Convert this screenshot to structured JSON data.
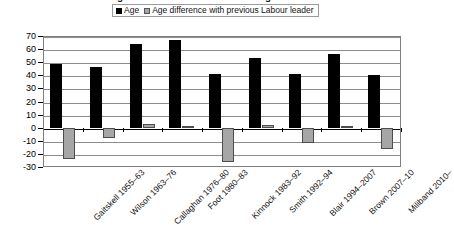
{
  "chart_data": {
    "type": "bar",
    "title": "Ages of Labour leaders on taking office",
    "categories": [
      "Gaitskell 1955–63",
      "Wilson 1963–76",
      "Callaghan 1976–80",
      "Foot 1980–83",
      "Kinnock 1983–92",
      "Smith 1992–94",
      "Blair 1994–2007",
      "Brown 2007–10",
      "Miliband 2010–"
    ],
    "series": [
      {
        "name": "Age",
        "color": "#000000",
        "values": [
          49,
          46,
          64,
          67,
          41,
          53,
          41,
          56,
          40
        ]
      },
      {
        "name": "Age difference with previous Labour leader",
        "color": "#a6a6a6",
        "values": [
          -24,
          -8,
          3,
          1,
          -26,
          2,
          -12,
          1,
          -16
        ]
      }
    ],
    "xlabel": "",
    "ylabel": "",
    "ylim": [
      -30,
      70
    ],
    "ytick_step": 10,
    "yticks": [
      70,
      60,
      50,
      40,
      30,
      20,
      10,
      0,
      -10,
      -20,
      -30
    ],
    "ytick_labels": [
      "70",
      "60",
      "50",
      "40",
      "30",
      "20",
      "10",
      "0",
      "-10",
      "-20",
      "-30"
    ],
    "grid": true,
    "legend_position": "top-center"
  },
  "legend": {
    "entries": [
      {
        "label": "Age"
      },
      {
        "label": "Age difference with previous Labour leader"
      }
    ]
  }
}
